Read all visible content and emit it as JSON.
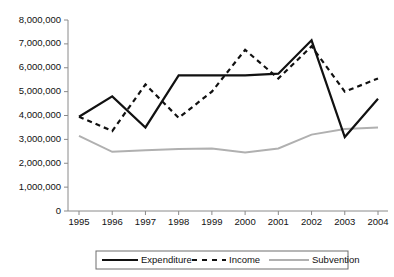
{
  "chart_data": {
    "type": "line",
    "title": "",
    "subtitle": "",
    "xlabel": "",
    "ylabel": "",
    "categories": [
      "1995",
      "1996",
      "1997",
      "1998",
      "1999",
      "2000",
      "2001",
      "2002",
      "2003",
      "2004"
    ],
    "x": [
      1995,
      1996,
      1997,
      1998,
      1999,
      2000,
      2001,
      2002,
      2003,
      2004
    ],
    "ylim": [
      0,
      8000000
    ],
    "ytick_values": [
      0,
      1000000,
      2000000,
      3000000,
      4000000,
      5000000,
      6000000,
      7000000,
      8000000
    ],
    "ytick_labels": [
      "0",
      "1,000,000",
      "2,000,000",
      "3,000,000",
      "4,000,000",
      "5,000,000",
      "6,000,000",
      "7,000,000",
      "8,000,000"
    ],
    "grid": false,
    "legend_position": "bottom",
    "series": [
      {
        "name": "Expenditure",
        "style": "solid",
        "color": "#111111",
        "width": 2.2,
        "values": [
          3950000,
          4800000,
          3500000,
          5680000,
          5680000,
          5680000,
          5750000,
          7150000,
          3100000,
          4700000
        ]
      },
      {
        "name": "Income",
        "style": "dashed",
        "color": "#111111",
        "width": 2.2,
        "values": [
          3950000,
          3350000,
          5300000,
          3900000,
          5000000,
          6750000,
          5550000,
          6900000,
          5000000,
          5550000
        ]
      },
      {
        "name": "Subvention",
        "style": "solid",
        "color": "#b0b0b0",
        "width": 2.0,
        "values": [
          3150000,
          2480000,
          2540000,
          2600000,
          2620000,
          2450000,
          2620000,
          3200000,
          3430000,
          3500000
        ]
      }
    ]
  },
  "legend": {
    "items": [
      {
        "label": "Expenditure",
        "marker": "solid-line-marker"
      },
      {
        "label": "Income",
        "marker": "dashed-line-marker"
      },
      {
        "label": "Subvention",
        "marker": "solid-gray-line-marker"
      }
    ]
  },
  "axes": {
    "y_axis_name": "value-axis",
    "x_axis_name": "year-axis"
  }
}
